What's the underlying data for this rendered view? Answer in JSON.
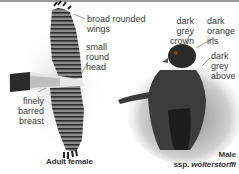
{
  "figure": {
    "panels": [
      {
        "id": "adult-female",
        "caption": "Adult female",
        "annotations": [
          {
            "text": "broad rounded\nwings"
          },
          {
            "text": "small\nround\nhead"
          },
          {
            "text": "finely\nbarred\nbreast"
          }
        ]
      },
      {
        "id": "male",
        "caption_line1": "Male",
        "caption_line2_prefix": "ssp. ",
        "caption_line2_italic": "wolterstorffi",
        "annotations": [
          {
            "text": "dark grey\ncrown"
          },
          {
            "text": "dark\norange\niris"
          },
          {
            "text": "dark\ngrey\nabove"
          }
        ]
      }
    ],
    "colors": {
      "border": "#9a9a9a",
      "label_text": "#3a3a3a",
      "bird_dark": "#2a2a2a",
      "bird_mid": "#6a6a6a"
    }
  }
}
